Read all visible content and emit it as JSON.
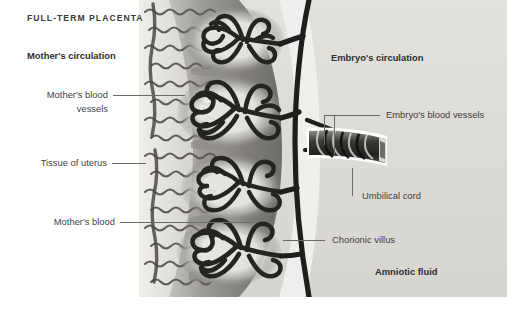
{
  "figure": {
    "title": "FULL-TERM PLACENTA",
    "type": "anatomical-cross-section-diagram",
    "subject": "full-term placenta",
    "background_color": "#ffffff",
    "illustration_palette": {
      "uterus_wall": "#cfcdc8",
      "maternal_blood_space": "#6f6f6f",
      "intervillous_pool": "#8a8a8a",
      "villus_outline": "#262626",
      "amniotic_fluid": "#dcdad5",
      "cord_dark": "#2a2a2a",
      "leader_line": "#6b6b6b"
    },
    "headings": [
      {
        "id": "mothers-circulation",
        "text": "Mother's circulation",
        "side": "left"
      },
      {
        "id": "embryos-circulation",
        "text": "Embryo's circulation",
        "side": "right"
      },
      {
        "id": "amniotic-fluid",
        "text": "Amniotic fluid",
        "side": "right"
      }
    ],
    "callouts": [
      {
        "id": "mothers-blood-vessels",
        "text_line1": "Mother's blood",
        "text_line2": "vessels",
        "side": "left",
        "points_to": "maternal spiral arteries in uterine wall"
      },
      {
        "id": "tissue-of-uterus",
        "text_line1": "Tissue of uterus",
        "text_line2": "",
        "side": "left",
        "points_to": "uterine wall (myometrium / decidua)"
      },
      {
        "id": "mothers-blood",
        "text_line1": "Mother's blood",
        "text_line2": "",
        "side": "left",
        "points_to": "intervillous blood pool"
      },
      {
        "id": "embryos-blood-vessels",
        "text_line1": "Embryo's blood vessels",
        "text_line2": "",
        "side": "right",
        "points_to": "umbilical artery and vein"
      },
      {
        "id": "umbilical-cord",
        "text_line1": "Umbilical cord",
        "text_line2": "",
        "side": "right",
        "points_to": "twisted umbilical cord"
      },
      {
        "id": "chorionic-villus",
        "text_line1": "Chorionic villus",
        "text_line2": "",
        "side": "right",
        "points_to": "branching villus tree"
      }
    ]
  }
}
